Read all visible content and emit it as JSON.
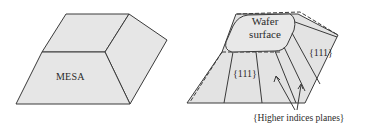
{
  "figure": {
    "left_panel": {
      "label": "MESA",
      "fill_color": "#e6e6e6",
      "stroke_color": "#333333"
    },
    "right_panel": {
      "top_label_line1": "Wafer",
      "top_label_line2": "surface",
      "plane_label_right": "{111}",
      "plane_label_front": "{111}",
      "annotation": "{Higher indices planes}",
      "fill_color": "#e3e3e3",
      "stroke_color": "#333333"
    }
  }
}
